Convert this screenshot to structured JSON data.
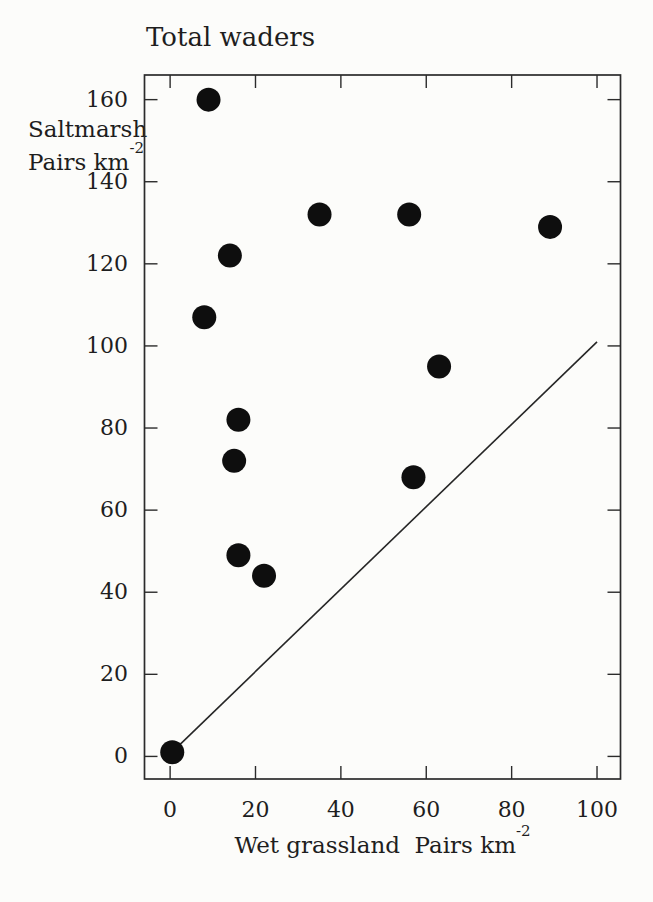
{
  "chart_data": {
    "type": "scatter",
    "title": "Total waders",
    "xlabel": "Wet grassland  Pairs km⁻²",
    "ylabel": "Saltmarsh Pairs km⁻²",
    "x_ticks": [
      0,
      20,
      40,
      60,
      80,
      100
    ],
    "y_ticks": [
      0,
      20,
      40,
      60,
      80,
      100,
      120,
      140,
      160
    ],
    "xlim": [
      -6,
      105.5
    ],
    "ylim": [
      -5.5,
      166
    ],
    "grid": false,
    "legend": "none",
    "series": [
      {
        "name": "sites",
        "marker": "filled-circle",
        "color": "#0e0e0e",
        "points": [
          {
            "x": 9,
            "y": 160
          },
          {
            "x": 35,
            "y": 132
          },
          {
            "x": 56,
            "y": 132
          },
          {
            "x": 89,
            "y": 129
          },
          {
            "x": 14,
            "y": 122
          },
          {
            "x": 8,
            "y": 107
          },
          {
            "x": 63,
            "y": 95
          },
          {
            "x": 16,
            "y": 82
          },
          {
            "x": 15,
            "y": 72
          },
          {
            "x": 57,
            "y": 68
          },
          {
            "x": 16,
            "y": 49
          },
          {
            "x": 22,
            "y": 44
          },
          {
            "x": 0.5,
            "y": 1
          }
        ]
      }
    ],
    "reference_line": {
      "name": "equality-line",
      "x1": 0.4,
      "y1": 1,
      "x2": 100,
      "y2": 101,
      "color": "#262626"
    }
  },
  "labels": {
    "title": "Total waders",
    "y_line1": "Saltmarsh",
    "y_line2_base": "Pairs km",
    "y_sup": "-2",
    "x_base": "Wet grassland  Pairs km",
    "x_sup": "-2"
  },
  "colors": {
    "background": "#fcfcfa",
    "axis": "#2b2b2b",
    "text": "#1e1e1e",
    "marker": "#0e0e0e"
  }
}
